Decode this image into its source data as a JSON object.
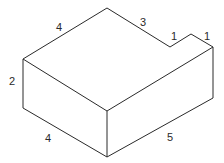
{
  "diagram": {
    "type": "isometric-block",
    "stroke_color": "#2a2a2a",
    "background": "#ffffff",
    "labels": {
      "top_left_edge": "4",
      "top_right_edge": "3",
      "notch_inner": "1",
      "notch_outer": "1",
      "left_height": "2",
      "bottom_left_edge": "4",
      "bottom_right_edge": "5"
    }
  }
}
